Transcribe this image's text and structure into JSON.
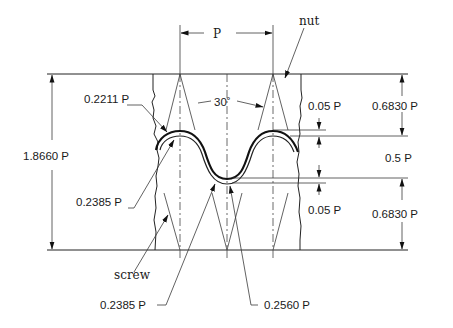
{
  "diagram": {
    "labels": {
      "pitch": "P",
      "nut": "nut",
      "screw": "screw",
      "angle": "30˚",
      "crest_radius_nut": "0.2211 P",
      "crest_radius_screw": "0.2385 P",
      "root_radius_screw": "0.2385 P",
      "root_radius_nut": "0.2560 P",
      "total_height": "1.8660 P",
      "clearance_top": "0.05 P",
      "clearance_bottom": "0.05 P",
      "thread_depth": "0.5 P",
      "upper_height": "0.6830 P",
      "lower_height": "0.6830 P"
    },
    "parts": [
      "nut",
      "screw"
    ],
    "dimensions": [
      {
        "name": "pitch",
        "value": "P"
      },
      {
        "name": "total height",
        "value": "1.8660 P"
      },
      {
        "name": "upper fundamental triangle part",
        "value": "0.6830 P"
      },
      {
        "name": "thread depth",
        "value": "0.5 P"
      },
      {
        "name": "lower fundamental triangle part",
        "value": "0.6830 P"
      },
      {
        "name": "crest clearance",
        "value": "0.05 P"
      },
      {
        "name": "root clearance",
        "value": "0.05 P"
      },
      {
        "name": "flank angle",
        "value": "30˚"
      },
      {
        "name": "radius",
        "value": "0.2211 P"
      },
      {
        "name": "radius",
        "value": "0.2385 P"
      },
      {
        "name": "radius",
        "value": "0.2385 P"
      },
      {
        "name": "radius",
        "value": "0.2560 P"
      }
    ]
  }
}
